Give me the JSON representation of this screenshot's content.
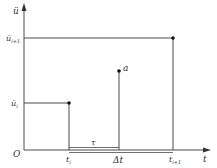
{
  "diagram": {
    "type": "piecewise acceleration over time step",
    "colors": {
      "line": "#4a4a4a",
      "dot": "#111111",
      "text": "#333333",
      "background": "#ffffff"
    },
    "axes": {
      "y_label": "ü",
      "x_label": "t",
      "origin_label": "O"
    },
    "y_ticks": [
      {
        "label_base": "ü",
        "label_sub": "i+1"
      },
      {
        "label_base": "ü",
        "label_sub": "i"
      }
    ],
    "x_ticks": [
      {
        "label_base": "t",
        "label_sub": "i"
      },
      {
        "label_base": "Δt",
        "label_sub": ""
      },
      {
        "label_base": "t",
        "label_sub": "i+1"
      }
    ],
    "annotations": {
      "tau_label": "τ",
      "point_label": "a"
    }
  }
}
